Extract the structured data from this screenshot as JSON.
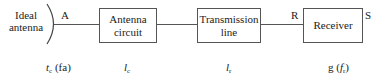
{
  "diagram": {
    "source": {
      "label_line1": "Ideal",
      "label_line2": "antenna"
    },
    "points": {
      "a": "A",
      "r": "R",
      "s": "S"
    },
    "blocks": [
      {
        "line1": "Antenna",
        "line2": "circuit"
      },
      {
        "line1": "Transmission",
        "line2": "line"
      },
      {
        "line1": "Receiver",
        "line2": ""
      }
    ],
    "parameters": [
      {
        "symbol": "t",
        "sub": "c",
        "suffix_pre": " (",
        "suffix_var": "fa",
        "suffix_post": ")"
      },
      {
        "symbol": "l",
        "sub": "c"
      },
      {
        "symbol": "l",
        "sub": "r"
      },
      {
        "prefix": "g (",
        "symbol": "f",
        "sub": "r",
        "suffix": ")"
      }
    ]
  }
}
